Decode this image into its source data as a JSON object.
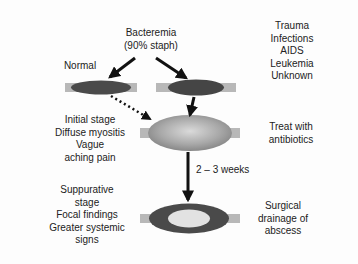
{
  "labels": {
    "bacteremia": [
      "Bacteremia",
      "(90% staph)"
    ],
    "normal": "Normal",
    "risk_factors": [
      "Trauma",
      "Infections",
      "AIDS",
      "Leukemia",
      "Unknown"
    ],
    "initial_stage": [
      "Initial stage",
      "Diffuse myositis",
      "Vague",
      "aching pain"
    ],
    "treat": [
      "Treat with",
      "antibiotics"
    ],
    "duration": "2 – 3 weeks",
    "suppurative_stage": [
      "Suppurative",
      "stage",
      "Focal findings",
      "Greater systemic",
      "signs"
    ],
    "surgical": [
      "Surgical",
      "drainage of",
      "abscess"
    ]
  },
  "colors": {
    "background": "#fdfdfd",
    "muscle_dark": "#4a4a4a",
    "tendon": "#b8b8b8",
    "swollen_light": "#d8d8d8",
    "swollen_mid": "#9a9a9a",
    "abscess_core": "#e2e2e2",
    "arrow": "#111111"
  },
  "nodes": [
    {
      "id": "normal-muscle",
      "desc": "Normal muscle (left)"
    },
    {
      "id": "infected-muscle",
      "desc": "Muscle with bacteremia seeding (right)"
    },
    {
      "id": "swollen-muscle",
      "desc": "Inflamed muscle - initial stage"
    },
    {
      "id": "abscess-muscle",
      "desc": "Muscle with abscess - suppurative stage"
    }
  ],
  "edges": [
    {
      "from": "bacteremia",
      "to": "normal-muscle",
      "style": "solid"
    },
    {
      "from": "bacteremia",
      "to": "infected-muscle",
      "style": "solid"
    },
    {
      "from": "normal-muscle",
      "to": "swollen-muscle",
      "style": "dotted"
    },
    {
      "from": "infected-muscle",
      "to": "swollen-muscle",
      "style": "solid"
    },
    {
      "from": "swollen-muscle",
      "to": "abscess-muscle",
      "style": "solid",
      "label": "2 – 3 weeks"
    }
  ]
}
